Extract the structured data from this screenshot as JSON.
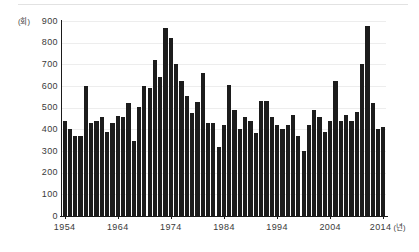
{
  "chart_data": {
    "type": "bar",
    "title": "",
    "subtitle": "",
    "xlabel": "(년)",
    "ylabel": "(회)",
    "y_unit_label": "(회)",
    "x_unit_label": "(년)",
    "ylim": [
      0,
      900
    ],
    "ytick_values": [
      0,
      100,
      200,
      300,
      400,
      500,
      600,
      700,
      800,
      900
    ],
    "ytick_labels": [
      "0",
      "100",
      "200",
      "300",
      "400",
      "500",
      "600",
      "700",
      "800",
      "900"
    ],
    "xtick_values": [
      1954,
      1964,
      1974,
      1984,
      1994,
      2004,
      2014
    ],
    "xtick_labels": [
      "1954",
      "1964",
      "1974",
      "1984",
      "1994",
      "2004",
      "2014"
    ],
    "xlim": [
      1953.5,
      2014.5
    ],
    "grid": true,
    "grid_axis": "y",
    "legend": null,
    "bar_color": "#1c1c1c",
    "background_color": "#ffffff",
    "categories": [
      "1954",
      "1955",
      "1956",
      "1957",
      "1958",
      "1959",
      "1960",
      "1961",
      "1962",
      "1963",
      "1964",
      "1965",
      "1966",
      "1967",
      "1968",
      "1969",
      "1970",
      "1971",
      "1972",
      "1973",
      "1974",
      "1975",
      "1976",
      "1977",
      "1978",
      "1979",
      "1980",
      "1981",
      "1982",
      "1983",
      "1984",
      "1985",
      "1986",
      "1987",
      "1988",
      "1989",
      "1990",
      "1991",
      "1992",
      "1993",
      "1994",
      "1995",
      "1996",
      "1997",
      "1998",
      "1999",
      "2000",
      "2001",
      "2002",
      "2003",
      "2004",
      "2005",
      "2006",
      "2007",
      "2008",
      "2009",
      "2010",
      "2011",
      "2012",
      "2013",
      "2014"
    ],
    "values": [
      440,
      400,
      370,
      370,
      600,
      430,
      440,
      455,
      390,
      430,
      460,
      455,
      520,
      345,
      505,
      600,
      590,
      720,
      640,
      870,
      820,
      700,
      625,
      555,
      475,
      525,
      660,
      430,
      430,
      320,
      420,
      605,
      490,
      400,
      455,
      440,
      385,
      530,
      530,
      455,
      420,
      400,
      420,
      465,
      370,
      300,
      420,
      490,
      455,
      390,
      440,
      625,
      440,
      465,
      440,
      480,
      700,
      875,
      520,
      400,
      410
    ]
  }
}
